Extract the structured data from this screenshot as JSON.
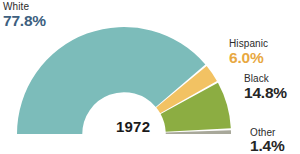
{
  "year": "1972",
  "colors": {
    "white": "#7cbcba",
    "hispanic": "#f2c263",
    "black": "#8cad42",
    "other": "#a8a89a",
    "white_text": "#3d5f80",
    "hispanic_text": "#e8a841",
    "black_text": "#262626",
    "other_text": "#262626",
    "background": "#ffffff"
  },
  "labels": {
    "white": {
      "name": "White",
      "pct": "77.8%"
    },
    "hispanic": {
      "name": "Hispanic",
      "pct": "6.0%"
    },
    "black": {
      "name": "Black",
      "pct": "14.8%"
    },
    "other": {
      "name": "Other",
      "pct": "1.4%"
    }
  },
  "chart_data": {
    "type": "pie",
    "variant": "half-donut",
    "title": "1972",
    "xlabel": "",
    "ylabel": "",
    "labels": [
      "White",
      "Hispanic",
      "Black",
      "Other"
    ],
    "values": [
      77.8,
      6.0,
      14.8,
      1.4
    ],
    "value_labels": [
      "77.8%",
      "6.0%",
      "14.8%",
      "1.4%"
    ],
    "colors": [
      "#7cbcba",
      "#f2c263",
      "#8cad42",
      "#a8a89a"
    ],
    "units": "percent",
    "total": 100.0,
    "start_angle_deg": 180,
    "end_angle_deg": 360,
    "direction": "clockwise",
    "inner_radius_ratio": 0.39,
    "legend": "inline-annotations",
    "grid": false,
    "annotations": [
      {
        "label": "White",
        "value": 77.8,
        "position": "upper-left"
      },
      {
        "label": "Hispanic",
        "value": 6.0,
        "position": "right-upper"
      },
      {
        "label": "Black",
        "value": 14.8,
        "position": "right-middle"
      },
      {
        "label": "Other",
        "value": 1.4,
        "position": "right-lower"
      }
    ]
  }
}
